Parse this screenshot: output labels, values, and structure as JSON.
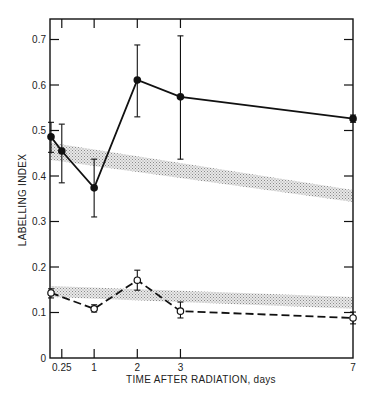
{
  "chart_data": {
    "type": "line",
    "title": "",
    "xlabel": "TIME AFTER RADIATION, days",
    "ylabel": "LABELLING INDEX",
    "xlim": [
      0,
      7
    ],
    "ylim": [
      0,
      0.75
    ],
    "grid": false,
    "x_ticks": [
      {
        "value": 0.25,
        "label": "0.25"
      },
      {
        "value": 1,
        "label": "1"
      },
      {
        "value": 2,
        "label": "2"
      },
      {
        "value": 3,
        "label": "3"
      },
      {
        "value": 7,
        "label": "7"
      }
    ],
    "y_ticks": [
      {
        "value": 0,
        "label": "0"
      },
      {
        "value": 0.1,
        "label": "0.1"
      },
      {
        "value": 0.2,
        "label": "0.2"
      },
      {
        "value": 0.3,
        "label": "0.3"
      },
      {
        "value": 0.4,
        "label": "0.4"
      },
      {
        "value": 0.5,
        "label": "0.5"
      },
      {
        "value": 0.6,
        "label": "0.6"
      },
      {
        "value": 0.7,
        "label": "0.7"
      }
    ],
    "series": [
      {
        "name": "filled-circles",
        "marker": "filled-circle",
        "line": "solid",
        "x": [
          0,
          0.25,
          1,
          2,
          3,
          7
        ],
        "y": [
          0.486,
          0.455,
          0.374,
          0.611,
          0.574,
          0.526
        ],
        "err_low": [
          0.452,
          0.385,
          0.31,
          0.53,
          0.437,
          0.518
        ],
        "err_high": [
          0.518,
          0.514,
          0.437,
          0.688,
          0.708,
          0.534
        ]
      },
      {
        "name": "open-circles",
        "marker": "open-circle",
        "line": "dashed",
        "x": [
          0,
          1,
          2,
          3,
          7
        ],
        "y": [
          0.143,
          0.108,
          0.171,
          0.103,
          0.088
        ],
        "err_low": [
          0.132,
          0.101,
          0.149,
          0.088,
          0.075
        ],
        "err_high": [
          0.152,
          0.117,
          0.193,
          0.123,
          0.101
        ]
      }
    ],
    "bands": [
      {
        "name": "upper-control-band",
        "x": [
          0,
          7
        ],
        "low": [
          0.435,
          0.343
        ],
        "high": [
          0.473,
          0.369
        ]
      },
      {
        "name": "lower-control-band",
        "x": [
          0,
          7
        ],
        "low": [
          0.134,
          0.108
        ],
        "high": [
          0.158,
          0.134
        ]
      }
    ],
    "colors": {
      "ink": "#111111",
      "band": "#bdbdbd"
    }
  }
}
